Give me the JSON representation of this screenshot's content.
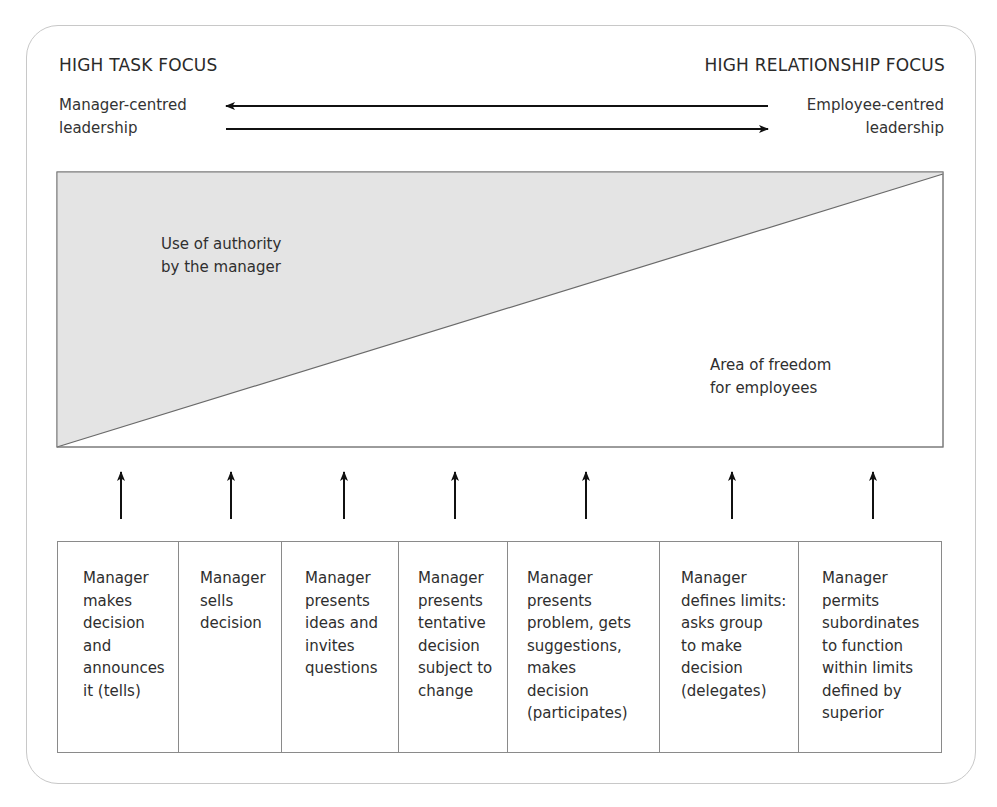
{
  "headings": {
    "left": "HIGH TASK FOCUS",
    "right": "HIGH RELATIONSHIP FOCUS"
  },
  "side_labels": {
    "left": [
      "Manager-centred",
      "leadership"
    ],
    "right": [
      "Employee-centred",
      "leadership"
    ]
  },
  "areas": {
    "authority": [
      "Use of authority",
      "by the manager"
    ],
    "freedom": [
      "Area of freedom",
      "for employees"
    ]
  },
  "colors": {
    "shaded_area": "#e4e4e4",
    "line": "#6a6a6a",
    "arrow": "#111111",
    "frame": "#c8c8c8"
  },
  "behaviours": [
    {
      "lines": [
        "Manager",
        "makes",
        "decision",
        "and",
        "announces",
        "it (tells)"
      ]
    },
    {
      "lines": [
        "Manager",
        "sells",
        "decision"
      ]
    },
    {
      "lines": [
        "Manager",
        "presents",
        "ideas and",
        "invites",
        "questions"
      ]
    },
    {
      "lines": [
        "Manager",
        "presents",
        "tentative",
        "decision",
        "subject to",
        "change"
      ]
    },
    {
      "lines": [
        "Manager",
        "presents",
        "problem, gets",
        "suggestions,",
        "makes",
        "decision",
        "(participates)"
      ]
    },
    {
      "lines": [
        "Manager",
        "defines limits:",
        "asks group",
        "to make",
        "decision",
        "(delegates)"
      ]
    },
    {
      "lines": [
        "Manager",
        "permits",
        "subordinates",
        "to function",
        "within limits",
        "defined by",
        "superior"
      ]
    }
  ]
}
